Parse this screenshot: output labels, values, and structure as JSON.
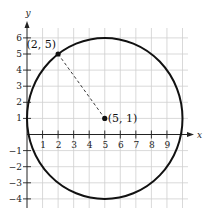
{
  "chart_data": {
    "type": "scatter",
    "title": "",
    "xlabel": "x",
    "ylabel": "y",
    "xlim": [
      0,
      10
    ],
    "ylim": [
      -4,
      6
    ],
    "grid": true,
    "x_ticks": [
      1,
      2,
      3,
      4,
      5,
      6,
      7,
      8,
      9
    ],
    "y_ticks": [
      -4,
      -3,
      -2,
      -1,
      1,
      2,
      3,
      4,
      5,
      6
    ],
    "tick_labels": {
      "x": [
        "1",
        "2",
        "3",
        "4",
        "5",
        "6",
        "7",
        "8",
        "9"
      ],
      "y": [
        "−4",
        "−3",
        "−2",
        "−1",
        "1",
        "2",
        "3",
        "4",
        "5",
        "6"
      ]
    },
    "points": [
      {
        "x": 2,
        "y": 5,
        "label": "(2, 5)"
      },
      {
        "x": 5,
        "y": 1,
        "label": "(5, 1)"
      }
    ],
    "circle": {
      "center": [
        5,
        1
      ],
      "radius": 5
    },
    "segments": [
      {
        "from": [
          2,
          5
        ],
        "to": [
          5,
          1
        ],
        "style": "dashed"
      }
    ]
  }
}
